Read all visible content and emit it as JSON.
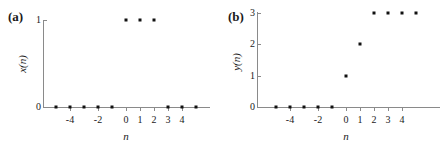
{
  "figure": {
    "background": "#ffffff",
    "axis_color": "#8a8a8a",
    "marker_color": "#111111",
    "text_color": "#1a1a1a"
  },
  "panels": [
    {
      "id": "a",
      "label": "(a)",
      "xlabel": "n",
      "ylabel": "x(n)",
      "geometry": {
        "origin_x": 126,
        "origin_y": 107,
        "x_unit_px": 14,
        "y_unit_px": 87,
        "axis_x_left": 43,
        "axis_x_right": 210,
        "axis_y_top": 20,
        "axis_y_bottom": 108,
        "label_x": 8,
        "label_y": 10,
        "xlabel_x": 126,
        "xlabel_y": 131,
        "ylabel_x": 22,
        "ylabel_y": 64
      },
      "chart_data": {
        "type": "scatter",
        "title": "(a)",
        "xlabel": "n",
        "ylabel": "x(n)",
        "x": [
          -5,
          -4,
          -3,
          -2,
          -1,
          0,
          1,
          2,
          3,
          4,
          5
        ],
        "values": [
          0,
          0,
          0,
          0,
          0,
          1,
          1,
          1,
          0,
          0,
          0
        ],
        "xticks": [
          -4,
          -2,
          0,
          1,
          2,
          3,
          4
        ],
        "xtick_labels": [
          "-4",
          "-2",
          "0",
          "1",
          "2",
          "3",
          "4"
        ],
        "yticks": [
          0,
          1
        ],
        "ytick_labels": [
          "0",
          "1"
        ],
        "xlim": [
          -5.9,
          6.0
        ],
        "ylim": [
          0,
          1
        ],
        "grid": false,
        "legend": "none"
      }
    },
    {
      "id": "b",
      "label": "(b)",
      "xlabel": "n",
      "ylabel": "y(n)",
      "geometry": {
        "origin_x": 346,
        "origin_y": 107,
        "x_unit_px": 14,
        "y_unit_px": 31.5,
        "axis_x_left": 257,
        "axis_x_right": 440,
        "axis_y_top": 12,
        "axis_y_bottom": 108,
        "label_x": 228,
        "label_y": 10,
        "xlabel_x": 346,
        "xlabel_y": 131,
        "ylabel_x": 236,
        "ylabel_y": 62
      },
      "chart_data": {
        "type": "scatter",
        "title": "(b)",
        "xlabel": "n",
        "ylabel": "y(n)",
        "x": [
          -5,
          -4,
          -3,
          -2,
          -1,
          0,
          1,
          2,
          3,
          4,
          5
        ],
        "values": [
          0,
          0,
          0,
          0,
          0,
          1,
          2,
          3,
          3,
          3,
          3
        ],
        "xticks": [
          -4,
          -2,
          0,
          1,
          2,
          3,
          4
        ],
        "xtick_labels": [
          "-4",
          "-2",
          "0",
          "1",
          "2",
          "3",
          "4"
        ],
        "yticks": [
          0,
          1,
          2,
          3
        ],
        "ytick_labels": [
          "0",
          "1",
          "2",
          "3"
        ],
        "xlim": [
          -5.9,
          6.0
        ],
        "ylim": [
          0,
          3
        ],
        "grid": false,
        "legend": "none"
      }
    }
  ]
}
